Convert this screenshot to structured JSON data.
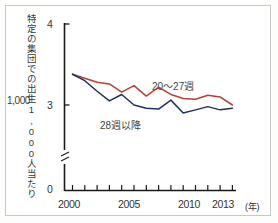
{
  "figure": {
    "y_axis_label": "特定の集団での出生1,000人当たりの胎児死亡率",
    "y_axis_label_number": "1,000",
    "x_axis_unit": "(年)"
  },
  "axis": {
    "y_ticks": [
      "4",
      "3",
      "0"
    ],
    "x_ticks": [
      "2000",
      "2005",
      "2010",
      "2013"
    ]
  },
  "legend": {
    "red_label": "20〜27週",
    "navy_label": "28週以降"
  },
  "colors": {
    "series_red": "#b24334",
    "series_navy": "#22305e",
    "axis": "#1a1a1a",
    "frame": "#c9c9c4",
    "text": "#333333"
  },
  "chart_data": {
    "type": "line",
    "title": "",
    "xlabel": "(年)",
    "ylabel": "特定の集団での出生1,000人当たりの胎児死亡率",
    "x": [
      2000,
      2001,
      2002,
      2003,
      2004,
      2005,
      2006,
      2007,
      2008,
      2009,
      2010,
      2011,
      2012,
      2013
    ],
    "xlim": [
      2000,
      2013
    ],
    "ylim": [
      0,
      4
    ],
    "y_break": true,
    "y_break_below": 2.5,
    "grid": false,
    "legend_position": "inline",
    "series": [
      {
        "name": "20〜27週",
        "color": "#b24334",
        "values": [
          3.38,
          3.33,
          3.28,
          3.26,
          3.16,
          3.24,
          3.11,
          3.22,
          3.13,
          3.08,
          3.07,
          3.12,
          3.1,
          3.0
        ]
      },
      {
        "name": "28週以降",
        "color": "#22305e",
        "values": [
          3.38,
          3.3,
          3.17,
          3.05,
          3.13,
          3.0,
          2.96,
          2.95,
          3.06,
          2.9,
          2.94,
          2.98,
          2.94,
          2.96
        ]
      }
    ]
  }
}
